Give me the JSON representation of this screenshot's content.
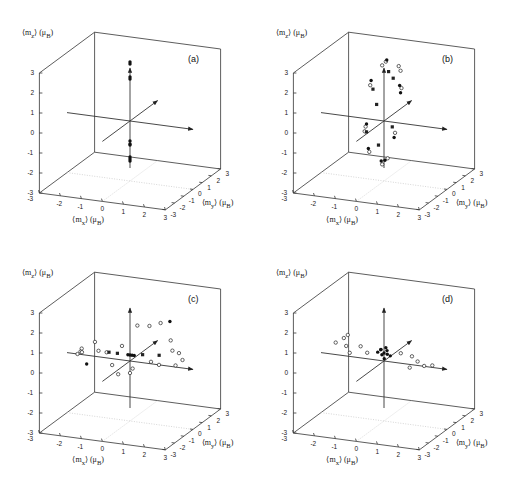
{
  "figure": {
    "panels": [
      {
        "id": "a",
        "label": "(a)",
        "left": 0,
        "top": 0
      },
      {
        "id": "b",
        "label": "(b)",
        "left": 254,
        "top": 0
      },
      {
        "id": "c",
        "label": "(c)",
        "left": 0,
        "top": 240
      },
      {
        "id": "d",
        "label": "(d)",
        "left": 254,
        "top": 240
      }
    ],
    "axis_labels": {
      "z": "⟨m_z⟩ (μ_B)",
      "x": "⟨m_x⟩ (μ_B)",
      "y": "⟨m_y⟩ (μ_B)",
      "z_html": "⟨m<sub>z</sub>⟩ (μ<sub>B</sub>)",
      "x_html": "⟨m<sub>x</sub>⟩ (μ<sub>B</sub>)",
      "y_html": "⟨m<sub>y</sub>⟩ (μ<sub>B</sub>)"
    },
    "z_ticks": [
      "3",
      "2",
      "1",
      "0",
      "-1",
      "-2",
      "-3"
    ],
    "x_ticks": [
      "-3",
      "-2",
      "-1",
      "0",
      "1",
      "2",
      "3"
    ],
    "y_ticks": [
      "-3",
      "-2",
      "-1",
      "0",
      "1",
      "2",
      "3"
    ]
  },
  "chart_data": [
    {
      "type": "scatter",
      "title": "(a)",
      "dimensions": 3,
      "xlabel": "⟨m_x⟩ (μ_B)",
      "ylabel": "⟨m_y⟩ (μ_B)",
      "zlabel": "⟨m_z⟩ (μ_B)",
      "xlim": [
        -3,
        3
      ],
      "ylim": [
        -3,
        3
      ],
      "zlim": [
        -3,
        3
      ],
      "description": "Moments aligned along the z-axis, clustered near m_z ≈ +2.9, +2.2 and -1.1, -1.9",
      "series": [
        {
          "name": "filled",
          "marker": "filled-circle",
          "points": [
            [
              0,
              0,
              2.95
            ],
            [
              0,
              0,
              2.85
            ],
            [
              0,
              0,
              2.2
            ],
            [
              0,
              0,
              2.1
            ],
            [
              0,
              0,
              -1.0
            ],
            [
              0,
              0,
              -1.15
            ],
            [
              0,
              0,
              -1.2
            ],
            [
              0,
              0,
              -1.8
            ],
            [
              0,
              0,
              -1.9
            ],
            [
              0,
              0,
              -2.0
            ]
          ]
        }
      ]
    },
    {
      "type": "scatter",
      "title": "(b)",
      "dimensions": 3,
      "xlabel": "⟨m_x⟩ (μ_B)",
      "ylabel": "⟨m_y⟩ (μ_B)",
      "zlabel": "⟨m_z⟩ (μ_B)",
      "xlim": [
        -3,
        3
      ],
      "ylim": [
        -3,
        3
      ],
      "zlim": [
        -3,
        3
      ],
      "description": "Moments distributed on a ring in the y-z plane",
      "series": [
        {
          "name": "open",
          "marker": "open-circle",
          "points": [
            [
              0,
              0.2,
              2.9
            ],
            [
              0,
              -0.2,
              2.85
            ],
            [
              0,
              1.6,
              2.2
            ],
            [
              0,
              1.8,
              1.9
            ],
            [
              0,
              -1.5,
              2.3
            ],
            [
              0,
              -2.0,
              0.4
            ],
            [
              0,
              -2.1,
              0.2
            ],
            [
              0,
              -1.6,
              -1.0
            ],
            [
              0,
              0.4,
              -2.0
            ],
            [
              0,
              -0.2,
              -2.1
            ],
            [
              0,
              1.9,
              1.0
            ],
            [
              0,
              1.2,
              -1.0
            ]
          ]
        },
        {
          "name": "filled",
          "marker": "filled-circle",
          "points": [
            [
              0,
              0.3,
              2.95
            ],
            [
              0,
              -1.4,
              2.5
            ],
            [
              0,
              1.7,
              1.2
            ],
            [
              0,
              1.8,
              0.8
            ],
            [
              0,
              -1.9,
              0.5
            ],
            [
              0,
              -1.7,
              -0.8
            ],
            [
              0,
              1.1,
              -1.2
            ],
            [
              0,
              0.1,
              -2.0
            ],
            [
              0,
              -0.3,
              -1.9
            ]
          ]
        },
        {
          "name": "square",
          "marker": "filled-square",
          "points": [
            [
              0,
              -1.2,
              2.0
            ],
            [
              0,
              0.5,
              2.3
            ],
            [
              0,
              1.0,
              1.8
            ],
            [
              0,
              -0.8,
              1.1
            ],
            [
              0,
              0.9,
              -0.6
            ],
            [
              0,
              -0.6,
              -1.0
            ],
            [
              0,
              -1.9,
              0.1
            ]
          ]
        }
      ]
    },
    {
      "type": "scatter",
      "title": "(c)",
      "dimensions": 3,
      "xlabel": "⟨m_x⟩ (μ_B)",
      "ylabel": "⟨m_y⟩ (μ_B)",
      "zlabel": "⟨m_z⟩ (μ_B)",
      "xlim": [
        -3,
        3
      ],
      "ylim": [
        -3,
        3
      ],
      "zlim": [
        -3,
        3
      ],
      "description": "Moments spread in the x-y plane near m_z ≈ 0, dense cluster at origin",
      "series": [
        {
          "name": "open",
          "marker": "open-circle",
          "points": [
            [
              -2.3,
              0,
              0.3
            ],
            [
              -2.4,
              0.1,
              0.1
            ],
            [
              -2.2,
              -0.2,
              0.2
            ],
            [
              -2.5,
              0,
              0
            ],
            [
              -1.8,
              0.3,
              0.6
            ],
            [
              -1.5,
              0,
              0.3
            ],
            [
              -1.2,
              0.2,
              0.2
            ],
            [
              -0.6,
              0.5,
              0.5
            ],
            [
              0,
              0.8,
              1.5
            ],
            [
              0.4,
              1.2,
              1.4
            ],
            [
              0.8,
              1.5,
              1.5
            ],
            [
              1.5,
              1.0,
              0.9
            ],
            [
              1.8,
              0.5,
              0.6
            ],
            [
              2.2,
              0.3,
              0.6
            ],
            [
              2.5,
              0,
              0.4
            ],
            [
              2.3,
              -0.3,
              0.2
            ],
            [
              1.6,
              -0.5,
              0.2
            ],
            [
              1.0,
              0,
              0.1
            ],
            [
              -0.3,
              -0.6,
              -0.5
            ],
            [
              0.3,
              -0.4,
              -0.2
            ],
            [
              0,
              0,
              -0.6
            ],
            [
              -0.5,
              -0.8,
              0
            ]
          ]
        },
        {
          "name": "filled",
          "marker": "filled-circle",
          "points": [
            [
              0,
              0,
              0.3
            ],
            [
              0.1,
              0,
              0.3
            ],
            [
              -0.1,
              0,
              0.3
            ],
            [
              0.2,
              0,
              0.3
            ],
            [
              -1.8,
              -0.6,
              -0.2
            ],
            [
              1.2,
              1.6,
              1.6
            ]
          ]
        },
        {
          "name": "square",
          "marker": "filled-square",
          "points": [
            [
              -0.6,
              0,
              0.3
            ],
            [
              0.6,
              0,
              0.4
            ],
            [
              1.3,
              0.2,
              0.4
            ],
            [
              -1.0,
              0,
              0.3
            ]
          ]
        }
      ]
    },
    {
      "type": "scatter",
      "title": "(d)",
      "dimensions": 3,
      "xlabel": "⟨m_x⟩ (μ_B)",
      "ylabel": "⟨m_y⟩ (μ_B)",
      "zlabel": "⟨m_z⟩ (μ_B)",
      "xlim": [
        -3,
        3
      ],
      "ylim": [
        -3,
        3
      ],
      "zlim": [
        -3,
        3
      ],
      "description": "Moments concentrated near the origin with spread along the x axis",
      "series": [
        {
          "name": "open",
          "marker": "open-circle",
          "points": [
            [
              -2.3,
              0,
              0.6
            ],
            [
              -2.0,
              0.2,
              0.8
            ],
            [
              -1.8,
              0,
              0.5
            ],
            [
              -1.5,
              -0.3,
              0.3
            ],
            [
              -1.2,
              0.2,
              0.5
            ],
            [
              -0.8,
              0,
              0.3
            ],
            [
              0.8,
              0,
              0.5
            ],
            [
              1.2,
              0.3,
              0.3
            ],
            [
              1.6,
              0,
              0.2
            ],
            [
              2.0,
              -0.2,
              0.1
            ],
            [
              2.3,
              0,
              0.1
            ],
            [
              1.4,
              -0.4,
              0
            ],
            [
              -1.9,
              0.4,
              0.9
            ]
          ]
        },
        {
          "name": "filled",
          "marker": "filled-circle",
          "points": [
            [
              0,
              0,
              0.4
            ],
            [
              0.1,
              0.1,
              0.5
            ],
            [
              -0.1,
              0,
              0.3
            ],
            [
              0.2,
              -0.1,
              0.4
            ],
            [
              -0.2,
              0.1,
              0.5
            ],
            [
              0,
              0.2,
              0.6
            ],
            [
              0.1,
              -0.2,
              0.2
            ],
            [
              -0.1,
              -0.1,
              0.6
            ],
            [
              0.3,
              0,
              0.3
            ],
            [
              -0.3,
              0,
              0.4
            ]
          ]
        }
      ]
    }
  ]
}
